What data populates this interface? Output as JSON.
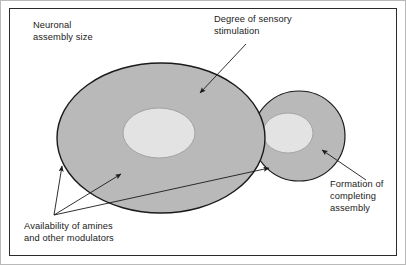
{
  "figure": {
    "type": "conceptual-diagram",
    "labels": {
      "neuronal_assembly_size": "Neuronal\nassembly size",
      "degree_of_sensory_stimulation": "Degree of sensory\nstimulation",
      "formation_of_completing_assembly": "Formation of\ncompleting\nassembly",
      "availability_of_amines": "Availability of amines\nand other modulators"
    },
    "colors": {
      "outer_ellipse_fill": "#b9b9b9",
      "inner_ellipse_fill": "#e2e2e2",
      "ellipse_stroke": "#1a1a1a",
      "inner_ellipse_stroke": "#9a9a9a",
      "arrow": "#1a1a1a",
      "frame": "#2b2b2b",
      "border": "#b9b9b9",
      "background": "#ffffff",
      "text": "#1a1a1a"
    },
    "shapes": {
      "large_assembly": {
        "cx": 161,
        "cy": 138,
        "rx": 104,
        "ry": 75
      },
      "large_assembly_core": {
        "cx": 159,
        "cy": 133,
        "rx": 36,
        "ry": 25
      },
      "small_assembly": {
        "cx": 299,
        "cy": 136,
        "rx": 46,
        "ry": 45
      },
      "small_assembly_core": {
        "cx": 288,
        "cy": 133,
        "rx": 25,
        "ry": 20
      }
    },
    "arrows": [
      {
        "name": "degree-arrow",
        "from": [
          246,
          44
        ],
        "to": [
          200,
          93
        ]
      },
      {
        "name": "formation-arrow",
        "from": [
          366,
          180
        ],
        "to": [
          322,
          150
        ]
      },
      {
        "name": "amines-arrow-upper-left",
        "from": [
          54,
          215
        ],
        "to": [
          62,
          166
        ]
      },
      {
        "name": "amines-arrow-middle",
        "from": [
          54,
          215
        ],
        "to": [
          121,
          174
        ]
      },
      {
        "name": "amines-arrow-right",
        "from": [
          54,
          215
        ],
        "to": [
          269,
          168
        ]
      }
    ]
  }
}
